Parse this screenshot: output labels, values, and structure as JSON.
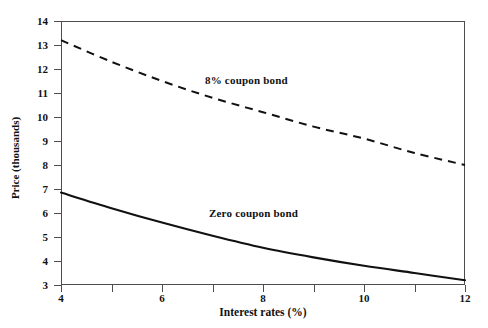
{
  "chart_data": {
    "type": "line",
    "title": "",
    "xlabel": "Interest rates (%)",
    "ylabel": "Price (thousands)",
    "xlim": [
      4,
      12
    ],
    "ylim": [
      3,
      14
    ],
    "grid": false,
    "legend_position": "inline-annotations",
    "x_ticks": [
      4,
      5,
      6,
      7,
      8,
      9,
      10,
      11,
      12
    ],
    "x_tick_labels": [
      "4",
      "",
      "6",
      "",
      "8",
      "",
      "10",
      "",
      "12"
    ],
    "y_ticks": [
      3,
      4,
      5,
      6,
      7,
      8,
      9,
      10,
      11,
      12,
      13,
      14
    ],
    "y_tick_labels": [
      "3",
      "4",
      "5",
      "6",
      "7",
      "8",
      "9",
      "10",
      "11",
      "12",
      "13",
      "14"
    ],
    "x": [
      4,
      5,
      6,
      7,
      8,
      9,
      10,
      11,
      12
    ],
    "series": [
      {
        "name": "8% coupon bond",
        "style": "dashed",
        "color": "#111111",
        "annotation": "8% coupon bond",
        "values": [
          13.2,
          12.3,
          11.5,
          10.8,
          10.2,
          9.6,
          9.1,
          8.5,
          8.0
        ]
      },
      {
        "name": "Zero coupon bond",
        "style": "solid",
        "color": "#111111",
        "annotation": "Zero coupon bond",
        "values": [
          6.85,
          6.2,
          5.6,
          5.05,
          4.55,
          4.15,
          3.8,
          3.5,
          3.2
        ]
      }
    ]
  },
  "axes": {
    "x_title": "Interest rates (%)",
    "y_title": "Price (thousands)"
  },
  "annotations": {
    "coupon_bond": "8% coupon bond",
    "zero_coupon_bond": "Zero coupon bond"
  },
  "colors": {
    "frame": "#4d4d4d",
    "ink": "#111111",
    "background": "#ffffff"
  }
}
